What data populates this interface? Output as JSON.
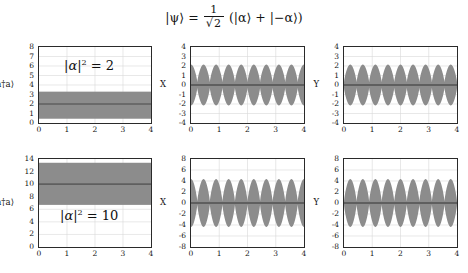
{
  "title": {
    "equation_text": "|ψ⟩ = (1/√2)(|α⟩ + |−α⟩)",
    "ket_psi": "|ψ⟩",
    "equals": "=",
    "numerator": "1",
    "radical": "√",
    "denominator_value": "2",
    "expression": "(|α⟩ + |−α⟩)"
  },
  "style": {
    "fill_color": "#8c8c8c",
    "mean_line_color": "#5f5f5f",
    "axis_color": "#2a2a2a",
    "grid_color": "#d8d8d8",
    "background": "#ffffff",
    "text_color": "#141414"
  },
  "chart_data": [
    {
      "id": "panel-n-alpha2",
      "type": "area",
      "row": 0,
      "col": 0,
      "title": "",
      "annotation": "|α|² = 2",
      "annotation_parts": {
        "base": "α",
        "power": "2",
        "rhs": "= 2"
      },
      "xlabel": "",
      "ylabel": "⟨a†a⟩",
      "xlim": [
        0,
        4
      ],
      "ylim": [
        0,
        8
      ],
      "xticks": [
        0,
        1,
        2,
        3,
        4
      ],
      "yticks": [
        0,
        1,
        2,
        3,
        4,
        5,
        6,
        7,
        8
      ],
      "grid": true,
      "band": {
        "lower": 0.45,
        "upper": 3.3,
        "mean": 2.0,
        "constant": true
      },
      "series": [
        {
          "name": "mean photon number",
          "kind": "horizontal-line",
          "value": 2.0
        },
        {
          "name": "uncertainty band",
          "kind": "constant-band",
          "lower": 0.45,
          "upper": 3.3
        }
      ]
    },
    {
      "id": "panel-x-alpha2",
      "type": "area",
      "row": 0,
      "col": 1,
      "title": "",
      "annotation": "",
      "xlabel": "",
      "ylabel": "X",
      "xlim": [
        0,
        4
      ],
      "ylim": [
        -4,
        4
      ],
      "xticks": [
        0,
        1,
        2,
        3,
        4
      ],
      "yticks": [
        -4,
        -3,
        -2,
        -1,
        0,
        1,
        2,
        3,
        4
      ],
      "grid": true,
      "oscillation": {
        "envelope_amplitude": 2.15,
        "cycles_over_range": 9,
        "phase_deg": 0,
        "mean_value": 0,
        "waveform": "abs-cosine-envelope",
        "pinch": 0.14
      },
      "series": [
        {
          "name": "X quadrature envelope",
          "kind": "oscillating-band",
          "amplitude": 2.15,
          "cycles": 9
        },
        {
          "name": "mean X",
          "kind": "horizontal-line",
          "value": 0.0
        }
      ]
    },
    {
      "id": "panel-y-alpha2",
      "type": "area",
      "row": 0,
      "col": 2,
      "title": "",
      "annotation": "",
      "xlabel": "",
      "ylabel": "Y",
      "xlim": [
        0,
        4
      ],
      "ylim": [
        -4,
        4
      ],
      "xticks": [
        0,
        1,
        2,
        3,
        4
      ],
      "yticks": [
        -4,
        -3,
        -2,
        -1,
        0,
        1,
        2,
        3,
        4
      ],
      "grid": true,
      "oscillation": {
        "envelope_amplitude": 2.15,
        "cycles_over_range": 9,
        "phase_deg": 90,
        "mean_value": 0,
        "waveform": "abs-cosine-envelope",
        "pinch": 0.14
      },
      "series": [
        {
          "name": "Y quadrature envelope",
          "kind": "oscillating-band",
          "amplitude": 2.15,
          "cycles": 9
        },
        {
          "name": "mean Y",
          "kind": "horizontal-line",
          "value": 0.0
        }
      ]
    },
    {
      "id": "panel-n-alpha10",
      "type": "area",
      "row": 1,
      "col": 0,
      "title": "",
      "annotation": "|α|² = 10",
      "annotation_parts": {
        "base": "α",
        "power": "2",
        "rhs": "= 10"
      },
      "xlabel": "",
      "ylabel": "⟨a†a⟩",
      "xlim": [
        0,
        4
      ],
      "ylim": [
        0,
        14
      ],
      "xticks": [
        0,
        1,
        2,
        3,
        4
      ],
      "yticks": [
        0,
        2,
        4,
        6,
        8,
        10,
        12,
        14
      ],
      "grid": true,
      "band": {
        "lower": 6.7,
        "upper": 13.4,
        "mean": 10.0,
        "constant": true
      },
      "series": [
        {
          "name": "mean photon number",
          "kind": "horizontal-line",
          "value": 10.0
        },
        {
          "name": "uncertainty band",
          "kind": "constant-band",
          "lower": 6.7,
          "upper": 13.4
        }
      ]
    },
    {
      "id": "panel-x-alpha10",
      "type": "area",
      "row": 1,
      "col": 1,
      "title": "",
      "annotation": "",
      "xlabel": "",
      "ylabel": "X",
      "xlim": [
        0,
        4
      ],
      "ylim": [
        -8,
        8
      ],
      "xticks": [
        0,
        1,
        2,
        3,
        4
      ],
      "yticks": [
        -8,
        -6,
        -4,
        -2,
        0,
        2,
        4,
        6,
        8
      ],
      "grid": true,
      "oscillation": {
        "envelope_amplitude": 4.35,
        "cycles_over_range": 9,
        "phase_deg": 0,
        "mean_value": 0,
        "waveform": "abs-cosine-envelope",
        "pinch": 0.06
      },
      "series": [
        {
          "name": "X quadrature envelope",
          "kind": "oscillating-band",
          "amplitude": 4.35,
          "cycles": 9
        },
        {
          "name": "mean X",
          "kind": "horizontal-line",
          "value": 0.0
        }
      ]
    },
    {
      "id": "panel-y-alpha10",
      "type": "area",
      "row": 1,
      "col": 2,
      "title": "",
      "annotation": "",
      "xlabel": "",
      "ylabel": "Y",
      "xlim": [
        0,
        4
      ],
      "ylim": [
        -8,
        8
      ],
      "xticks": [
        0,
        1,
        2,
        3,
        4
      ],
      "yticks": [
        -8,
        -6,
        -4,
        -2,
        0,
        2,
        4,
        6,
        8
      ],
      "grid": true,
      "oscillation": {
        "envelope_amplitude": 4.35,
        "cycles_over_range": 9,
        "phase_deg": 90,
        "mean_value": 0,
        "waveform": "abs-cosine-envelope",
        "pinch": 0.06
      },
      "series": [
        {
          "name": "Y quadrature envelope",
          "kind": "oscillating-band",
          "amplitude": 4.35,
          "cycles": 9
        },
        {
          "name": "mean Y",
          "kind": "horizontal-line",
          "value": 0.0
        }
      ]
    }
  ],
  "layout": {
    "panel_boxes": [
      {
        "id": "panel-n-alpha2",
        "left": 38,
        "top": 46,
        "width": 114,
        "height": 78
      },
      {
        "id": "panel-x-alpha2",
        "left": 190,
        "top": 46,
        "width": 115,
        "height": 78
      },
      {
        "id": "panel-y-alpha2",
        "left": 343,
        "top": 46,
        "width": 115,
        "height": 78
      },
      {
        "id": "panel-n-alpha10",
        "left": 38,
        "top": 158,
        "width": 114,
        "height": 90
      },
      {
        "id": "panel-x-alpha10",
        "left": 190,
        "top": 158,
        "width": 115,
        "height": 90
      },
      {
        "id": "panel-y-alpha10",
        "left": 343,
        "top": 158,
        "width": 115,
        "height": 90
      }
    ]
  }
}
